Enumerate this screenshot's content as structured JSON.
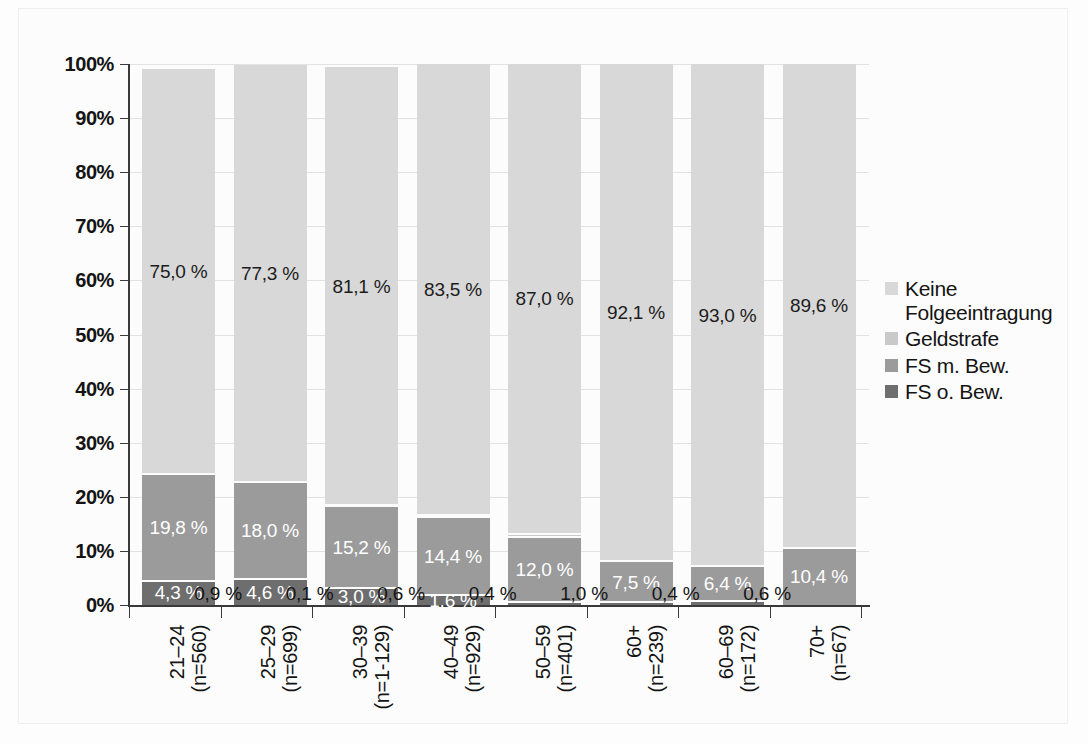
{
  "chart_data": {
    "type": "bar",
    "subtype": "stacked-bar-100-percent",
    "title": "",
    "xlabel": "",
    "ylabel": "",
    "ylim": [
      0,
      100
    ],
    "ytick_labels": [
      "0%",
      "10%",
      "20%",
      "30%",
      "40%",
      "50%",
      "60%",
      "70%",
      "80%",
      "90%",
      "100%"
    ],
    "ytick_values": [
      0,
      10,
      20,
      30,
      40,
      50,
      60,
      70,
      80,
      90,
      100
    ],
    "grid": true,
    "legend_position": "right",
    "categories": [
      "21–24\n(n=560)",
      "25–29\n(n=699)",
      "30–39\n(n=1-129)",
      "40–49\n(n=929)",
      "50–59\n(n=401)",
      "60+\n(n=239)",
      "60–69\n(n=172)",
      "70+\n(n=67)"
    ],
    "category_lines": [
      {
        "age": "21–24",
        "n": "(n=560)"
      },
      {
        "age": "25–29",
        "n": "(n=699)"
      },
      {
        "age": "30–39",
        "n": "(n=1-129)"
      },
      {
        "age": "40–49",
        "n": "(n=929)"
      },
      {
        "age": "50–59",
        "n": "(n=401)"
      },
      {
        "age": "60+",
        "n": "(n=239)"
      },
      {
        "age": "60–69",
        "n": "(n=172)"
      },
      {
        "age": "70+",
        "n": "(n=67)"
      }
    ],
    "series": [
      {
        "name": "Keine Folgeeintragung",
        "color": "#d8d8d8",
        "values": [
          75.0,
          77.3,
          81.1,
          83.5,
          87.0,
          92.1,
          93.0,
          89.6
        ],
        "labels": [
          "75,0 %",
          "77,3 %",
          "81,1 %",
          "83,5 %",
          "87,0 %",
          "92,1 %",
          "93,0 %",
          "89,6 %"
        ]
      },
      {
        "name": "Geldstrafe",
        "color": "#c9c9c9",
        "values": [
          0.0,
          0.0,
          0.1,
          0.5,
          0.6,
          0.0,
          0.0,
          0.0
        ],
        "labels": [
          "",
          "",
          "",
          "",
          "",
          "",
          "",
          ""
        ]
      },
      {
        "name": "FS m. Bew.",
        "color": "#9b9b9b",
        "values": [
          19.8,
          18.0,
          15.2,
          14.4,
          12.0,
          7.5,
          6.4,
          10.4
        ],
        "labels": [
          "19,8 %",
          "18,0 %",
          "15,2 %",
          "14,4 %",
          "12,0 %",
          "7,5 %",
          "6,4 %",
          "10,4 %"
        ]
      },
      {
        "name": "FS o. Bew.",
        "color": "#6e6e6e",
        "values": [
          4.3,
          4.6,
          3.0,
          1.6,
          0.4,
          0.4,
          0.6,
          0.0
        ],
        "labels": [
          "4,3 %",
          "4,6 %",
          "3,0 %",
          "1,6 %",
          "",
          "",
          "",
          ""
        ]
      }
    ],
    "outside_labels": [
      "0,9 %",
      "0,1 %",
      "0,6 %",
      "0,4 %",
      "1,0 %",
      "0,4 %",
      "0,6 %"
    ],
    "outside_label_values": [
      0.9,
      0.1,
      0.6,
      0.4,
      1.0,
      0.4,
      0.6
    ]
  },
  "legend": {
    "items": [
      {
        "label": "Keine",
        "label2": "Folgeeintragung",
        "color": "#d8d8d8"
      },
      {
        "label": "Geldstrafe",
        "label2": "",
        "color": "#c9c9c9"
      },
      {
        "label": "FS m. Bew.",
        "label2": "",
        "color": "#9b9b9b"
      },
      {
        "label": "FS o. Bew.",
        "label2": "",
        "color": "#6e6e6e"
      }
    ]
  }
}
